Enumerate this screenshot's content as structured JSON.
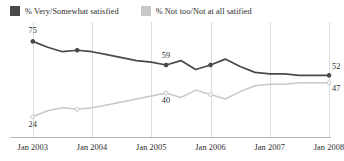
{
  "legend": {
    "position": "top-left",
    "entries": [
      {
        "label": "% Very/Somewhat satisfied",
        "color": "#4a4a4a",
        "swatch_icon": "square-swatch"
      },
      {
        "label": "% Not too/Not at all satified",
        "color": "#c8c8c8",
        "swatch_icon": "square-swatch"
      }
    ]
  },
  "axis": {
    "ticks": [
      {
        "label": "Jan 2003"
      },
      {
        "label": "Jan 2004"
      },
      {
        "label": "Jan 2005"
      },
      {
        "label": "Jan 2006"
      },
      {
        "label": "Jan 2007"
      },
      {
        "label": "Jan 2008"
      }
    ]
  },
  "annotations": {
    "satisfied_start": "75",
    "satisfied_mid": "59",
    "satisfied_end": "52",
    "unsatisfied_start": "24",
    "unsatisfied_mid": "40",
    "unsatisfied_end": "47"
  },
  "chart_data": {
    "type": "line",
    "title": "",
    "xlabel": "",
    "ylabel": "",
    "ylim": [
      15,
      80
    ],
    "xlim": [
      0,
      21
    ],
    "grid": "vertical-only",
    "legend_position": "top-left",
    "x_tick_labels": [
      "Jan 2003",
      "Jan 2004",
      "Jan 2005",
      "Jan 2006",
      "Jan 2007",
      "Jan 2008"
    ],
    "x_tick_positions": [
      1,
      5,
      9,
      13,
      17,
      21
    ],
    "series": [
      {
        "name": "% Very/Somewhat satisfied",
        "color": "#4a4a4a",
        "x": [
          1,
          2,
          3,
          4,
          5,
          6,
          7,
          8,
          9,
          10,
          11,
          12,
          13,
          14,
          15,
          16,
          17,
          18,
          19,
          20,
          21
        ],
        "values": [
          75,
          71,
          68,
          69,
          68,
          66,
          64,
          62,
          61,
          59,
          62,
          56,
          59,
          63,
          58,
          54,
          53,
          53,
          52,
          52,
          52
        ],
        "point_labels": {
          "1": "75",
          "10": "59",
          "21": "52"
        }
      },
      {
        "name": "% Not too/Not at all satified",
        "color": "#c8c8c8",
        "x": [
          1,
          2,
          3,
          4,
          5,
          6,
          7,
          8,
          9,
          10,
          11,
          12,
          13,
          14,
          15,
          16,
          17,
          18,
          19,
          20,
          21
        ],
        "values": [
          24,
          28,
          30,
          29,
          30,
          32,
          34,
          36,
          38,
          40,
          37,
          42,
          39,
          36,
          41,
          45,
          46,
          46,
          47,
          47,
          47
        ],
        "point_labels": {
          "1": "24",
          "10": "40",
          "21": "47"
        }
      }
    ]
  }
}
